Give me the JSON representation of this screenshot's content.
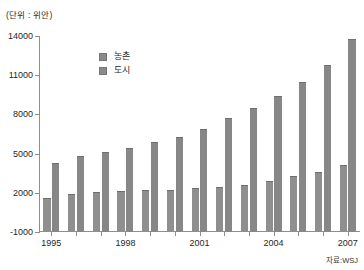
{
  "unit_label": "(단위 : 위안)",
  "source_label": "자료:WSJ",
  "legend": {
    "items": [
      {
        "label": "농촌",
        "color": "#8f8f8f"
      },
      {
        "label": "도시",
        "color": "#878787"
      }
    ]
  },
  "chart_data": {
    "type": "bar",
    "title": "",
    "subtitle": "",
    "xlabel": "",
    "ylabel": "",
    "unit": "위안",
    "ylim": [
      -1000,
      14000
    ],
    "yticks": [
      -1000,
      2000,
      5000,
      8000,
      11000,
      14000
    ],
    "ytick_labels": [
      "-1000",
      "2000",
      "5000",
      "8000",
      "11000",
      "14000"
    ],
    "grid": false,
    "legend_position": "upper-left-inside",
    "categories": [
      "1995",
      "1996",
      "1997",
      "1998",
      "1999",
      "2000",
      "2001",
      "2002",
      "2003",
      "2004",
      "2005",
      "2006",
      "2007"
    ],
    "xtick_labels": [
      "1995",
      "1998",
      "2001",
      "2004",
      "2007"
    ],
    "xtick_categories": [
      "1995",
      "1998",
      "2001",
      "2004",
      "2007"
    ],
    "series": [
      {
        "name": "농촌",
        "color": "#8f8f8f",
        "values": [
          1578,
          1926,
          2090,
          2162,
          2210,
          2253,
          2366,
          2476,
          2622,
          2936,
          3255,
          3587,
          4140
        ]
      },
      {
        "name": "도시",
        "color": "#878787",
        "values": [
          4283,
          4839,
          5160,
          5425,
          5854,
          6280,
          6860,
          7703,
          8472,
          9422,
          10493,
          11760,
          13786
        ]
      }
    ],
    "annotations": [
      "(단위 : 위안)",
      "자료:WSJ"
    ]
  }
}
